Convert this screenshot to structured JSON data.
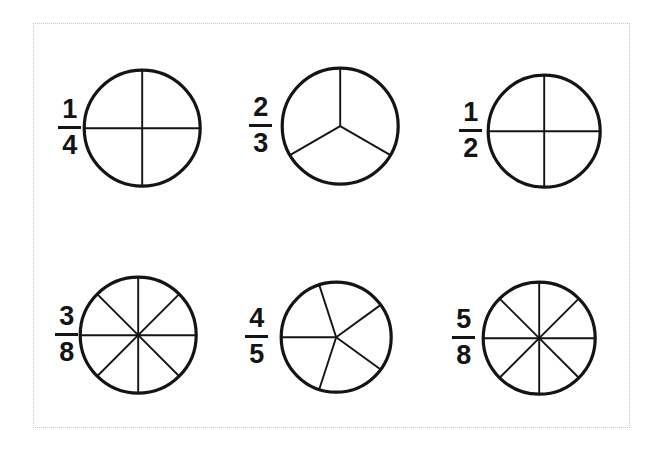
{
  "page": {
    "width": 661,
    "height": 450,
    "background_color": "#ffffff",
    "border_color": "#c9c9c9",
    "ink_color": "#141414"
  },
  "chart_data": {
    "type": "pie",
    "legend": "none",
    "items": [
      {
        "id": "fraction-one-quarter",
        "numerator": "1",
        "denominator": "4",
        "label": "1/4",
        "value": 0.25,
        "sectors": 4,
        "spoke_angles_deg": [
          90,
          180,
          270,
          360
        ],
        "center_x": 149,
        "center_y": 128,
        "radius": 58,
        "label_x": 58,
        "label_y": 98,
        "row": 1,
        "col": 1
      },
      {
        "id": "fraction-two-thirds",
        "numerator": "2",
        "denominator": "3",
        "label": "2/3",
        "value": 0.6667,
        "sectors": 3,
        "spoke_angles_deg": [
          90,
          210,
          330
        ],
        "center_x": 347,
        "center_y": 126,
        "radius": 58,
        "label_x": 249,
        "label_y": 96,
        "row": 1,
        "col": 2
      },
      {
        "id": "fraction-one-half",
        "numerator": "1",
        "denominator": "2",
        "label": "1/2",
        "value": 0.5,
        "sectors": 4,
        "spoke_angles_deg": [
          90,
          180,
          270,
          360
        ],
        "center_x": 551,
        "center_y": 131,
        "radius": 56,
        "label_x": 459,
        "label_y": 101,
        "row": 1,
        "col": 3
      },
      {
        "id": "fraction-three-eighths",
        "numerator": "3",
        "denominator": "8",
        "label": "3/8",
        "value": 0.375,
        "sectors": 8,
        "spoke_angles_deg": [
          90,
          135,
          180,
          225,
          270,
          315,
          360,
          45
        ],
        "center_x": 145,
        "center_y": 335,
        "radius": 58,
        "label_x": 55,
        "label_y": 305,
        "row": 2,
        "col": 1
      },
      {
        "id": "fraction-four-fifths",
        "numerator": "4",
        "denominator": "5",
        "label": "4/5",
        "value": 0.8,
        "sectors": 5,
        "spoke_angles_deg": [
          180,
          108,
          36,
          324,
          252
        ],
        "center_x": 343,
        "center_y": 337,
        "radius": 55,
        "label_x": 245,
        "label_y": 306,
        "row": 2,
        "col": 2
      },
      {
        "id": "fraction-five-eighths",
        "numerator": "5",
        "denominator": "8",
        "label": "5/8",
        "value": 0.625,
        "sectors": 8,
        "spoke_angles_deg": [
          90,
          135,
          180,
          225,
          270,
          315,
          360,
          45
        ],
        "center_x": 546,
        "center_y": 338,
        "radius": 56,
        "label_x": 452,
        "label_y": 308,
        "row": 2,
        "col": 3
      }
    ]
  }
}
